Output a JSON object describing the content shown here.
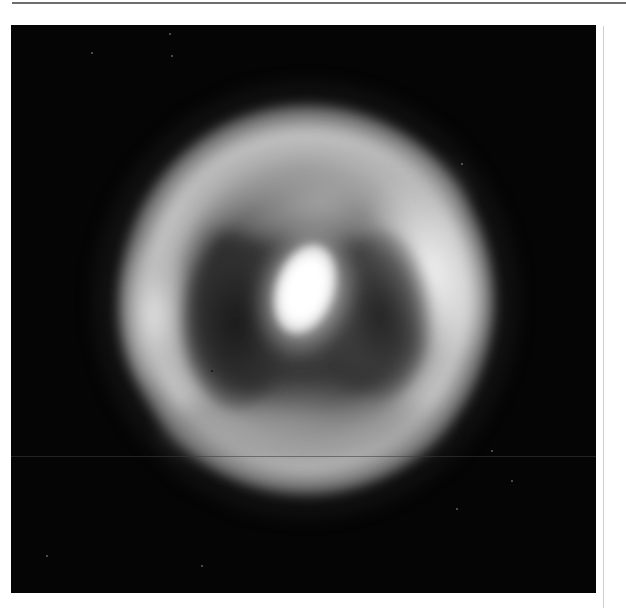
{
  "image": {
    "subject": "nebula-ring-with-bright-central-source",
    "description": "Grayscale astronomical image: bright elliptical ring/shell with a very bright off-center core flanked by two dark cavities",
    "colors": {
      "page_background": "#ffffff",
      "frame_background": "#050505",
      "top_rule": "#6e6e6e",
      "side_rule": "#cfcfcf",
      "core": "#ffffff",
      "ring": "#d7d7d7",
      "cavity": "#2a2a2a"
    },
    "features": [
      {
        "name": "central-core",
        "center": [
          300,
          280
        ],
        "size": [
          58,
          92
        ],
        "brightness": "saturated"
      },
      {
        "name": "left-cavity",
        "center": [
          236,
          322
        ],
        "brightness": "dark"
      },
      {
        "name": "right-cavity",
        "center": [
          381,
          315
        ],
        "brightness": "dark"
      },
      {
        "name": "left-lobe",
        "center": [
          154,
          315
        ],
        "brightness": "bright"
      },
      {
        "name": "right-arc",
        "center": [
          426,
          270
        ],
        "brightness": "bright"
      },
      {
        "name": "top-arc",
        "center": [
          321,
          190
        ],
        "brightness": "medium-bright"
      },
      {
        "name": "bottom-arc",
        "center": [
          306,
          430
        ],
        "brightness": "medium"
      }
    ]
  }
}
